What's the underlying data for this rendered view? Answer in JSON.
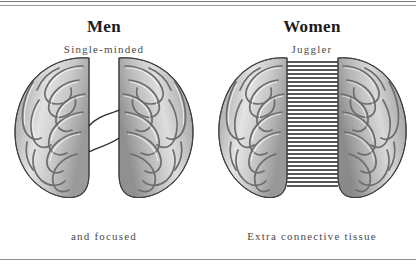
{
  "figure": {
    "name": "male-vs-female-brain-diagram",
    "background": "#ffffff",
    "rule_color": "#8d8d8d",
    "ink_color": "#231f20",
    "panels": [
      {
        "id": "men",
        "title": "Men",
        "subtitle": "Single-minded",
        "caption": "and focused",
        "brain": {
          "label": "male-brain-top-view",
          "connector_style": "two-thin-curved-lines",
          "connector_count": 2,
          "hemisphere_gap_px": 22
        }
      },
      {
        "id": "women",
        "title": "Women",
        "subtitle": "Juggler",
        "caption": "Extra connective tissue",
        "brain": {
          "label": "female-brain-top-view",
          "connector_style": "dense-horizontal-stripes",
          "connector_count": 34,
          "hemisphere_gap_px": 36
        }
      }
    ]
  }
}
